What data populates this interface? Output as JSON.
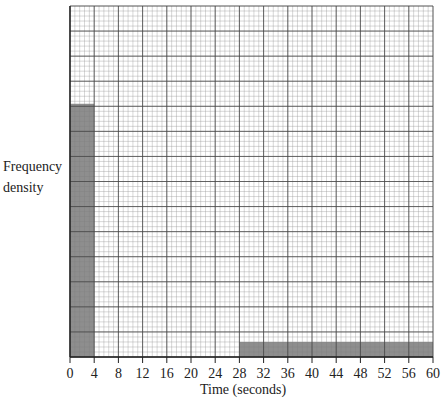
{
  "chart_data": {
    "type": "bar",
    "title": "",
    "xlabel": "Time (seconds)",
    "ylabel": "Frequency density",
    "x_ticks": [
      0,
      4,
      8,
      12,
      16,
      20,
      24,
      28,
      32,
      36,
      40,
      44,
      48,
      52,
      56,
      60
    ],
    "xlim": [
      0,
      60
    ],
    "grid": true,
    "histogram": true,
    "bins": [
      {
        "start": 0,
        "end": 4,
        "height_major_squares": 10.1
      },
      {
        "start": 28,
        "end": 60,
        "height_major_squares": 0.6
      }
    ],
    "y_major_squares": 14,
    "bar_color": "#7a7a7a"
  },
  "labels": {
    "ylabel_line1": "Frequency",
    "ylabel_line2": "density",
    "xlabel": "Time (seconds)"
  }
}
